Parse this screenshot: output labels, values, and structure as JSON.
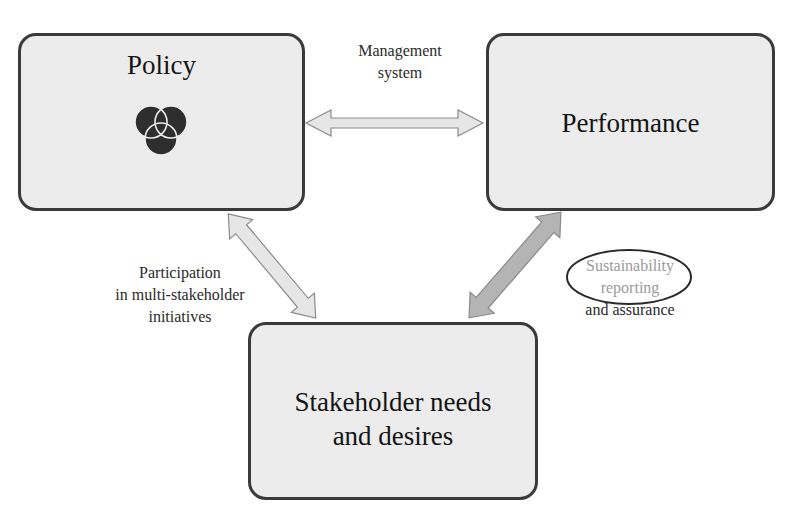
{
  "diagram": {
    "nodes": {
      "policy": {
        "title": "Policy",
        "icon": "venn-diagram-icon"
      },
      "performance": {
        "title": "Performance"
      },
      "stakeholder": {
        "title_line1": "Stakeholder needs",
        "title_line2": "and desires"
      }
    },
    "edges": {
      "policy_performance": {
        "label_line1": "Management",
        "label_line2": "system",
        "style": "light"
      },
      "policy_stakeholder": {
        "label_line1": "Participation",
        "label_line2": "in multi-stakeholder",
        "label_line3": "initiatives",
        "style": "light"
      },
      "performance_stakeholder": {
        "label_line1": "Sustainability",
        "label_line2": "reporting",
        "label_line3": "and assurance",
        "highlighted": "Sustainability reporting",
        "style": "dark"
      }
    },
    "colors": {
      "box_fill": "#ececec",
      "box_border": "#3a3a3a",
      "arrow_light": "#e6e6e6",
      "arrow_dark": "#b4b4b4",
      "highlight_text": "#9a9a9a"
    }
  }
}
